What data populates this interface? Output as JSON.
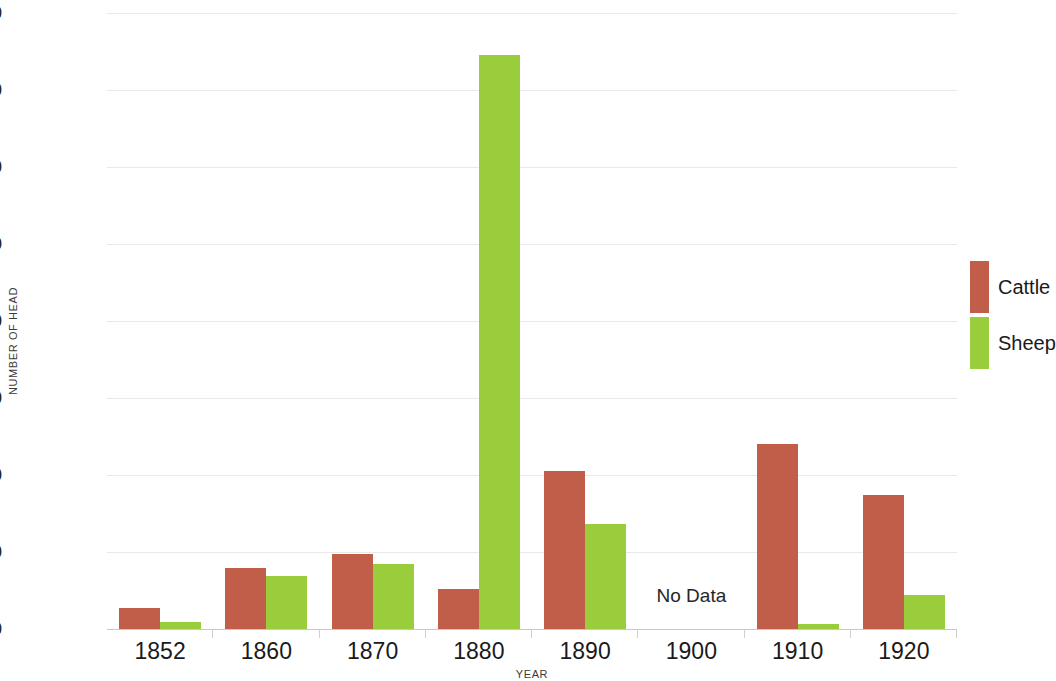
{
  "chart_data": {
    "type": "bar",
    "title": "",
    "xlabel": "YEAR",
    "ylabel": "NUMBER OF HEAD",
    "categories": [
      "1852",
      "1860",
      "1870",
      "1880",
      "1890",
      "1900",
      "1910",
      "1920"
    ],
    "series": [
      {
        "name": "Cattle",
        "color": "#c05e4a",
        "values": [
          5400,
          15800,
          19500,
          10400,
          41000,
          null,
          48000,
          34800
        ]
      },
      {
        "name": "Sheep",
        "color": "#9acd3c",
        "values": [
          1700,
          13700,
          16900,
          149000,
          27200,
          null,
          1400,
          8800
        ]
      }
    ],
    "ylim": [
      0,
      160000
    ],
    "ytick_step": 20000,
    "yticks": [
      0,
      20000,
      40000,
      60000,
      80000,
      100000,
      120000,
      140000,
      160000
    ],
    "ytick_labels": [
      "0",
      "20,000",
      "40,000",
      "60,000",
      "80,000",
      "100,000",
      "120,000",
      "140,000",
      "160,000"
    ],
    "grid": true,
    "legend_position": "right",
    "annotations": [
      {
        "text": "No Data",
        "category": "1900"
      }
    ]
  },
  "legend": {
    "items": [
      {
        "label": "Cattle",
        "color": "#c05e4a"
      },
      {
        "label": "Sheep",
        "color": "#9acd3c"
      }
    ]
  }
}
